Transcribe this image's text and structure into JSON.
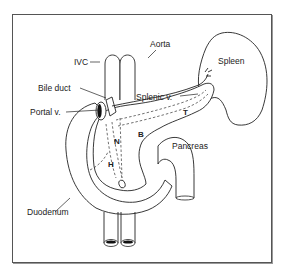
{
  "figure": {
    "type": "anatomical-diagram",
    "labels": {
      "ivc": "IVC",
      "aorta": "Aorta",
      "spleen": "Spleen",
      "bile_duct": "Bile duct",
      "splenic_v": "Splenic v.",
      "portal_v": "Portal v.",
      "pancreas": "Pancreas",
      "duodenum": "Duodenum",
      "head": "H",
      "neck": "N",
      "body": "B",
      "tail": "T"
    },
    "colors": {
      "line": "#222222",
      "frame": "#555555",
      "background": "#ffffff"
    }
  }
}
